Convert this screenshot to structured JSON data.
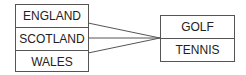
{
  "left_set": {
    "items": [
      "ENGLAND",
      "SCOTLAND",
      "WALES"
    ]
  },
  "right_set": {
    "items": [
      "GOLF",
      "TENNIS"
    ]
  },
  "mappings": [
    {
      "from": "ENGLAND",
      "to": "GOLF/TENNIS junction"
    },
    {
      "from": "SCOTLAND",
      "to": "GOLF/TENNIS junction"
    },
    {
      "from": "WALES",
      "to": "GOLF/TENNIS junction"
    }
  ],
  "colors": {
    "line": "#555555",
    "text": "#222222"
  }
}
